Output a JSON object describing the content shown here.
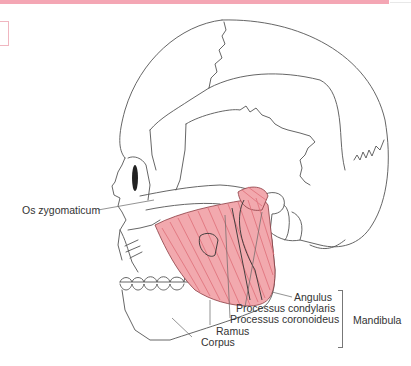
{
  "diagram": {
    "colors": {
      "header_bar": "#f4a6b4",
      "muscle": "#e8848c",
      "line": "#555555"
    },
    "labels": {
      "os_zygomaticum": "Os zygomaticum",
      "angulus": "Angulus",
      "processus_condylaris": "Processus condylaris",
      "processus_coronoideus": "Processus coronoideus",
      "ramus": "Ramus",
      "corpus": "Corpus",
      "mandibula": "Mandibula"
    }
  }
}
